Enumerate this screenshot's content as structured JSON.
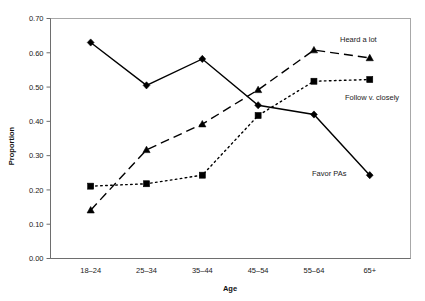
{
  "chart_data": {
    "type": "line",
    "title": "",
    "xlabel": "Age",
    "ylabel": "Proportion",
    "categories": [
      "18–24",
      "25–34",
      "35–44",
      "45–54",
      "55–64",
      "65+"
    ],
    "ylim": [
      0.0,
      0.7
    ],
    "ytick_labels": [
      "0.00",
      "0.10",
      "0.20",
      "0.30",
      "0.40",
      "0.50",
      "0.60",
      "0.70"
    ],
    "ytick_values": [
      0.0,
      0.1,
      0.2,
      0.3,
      0.4,
      0.5,
      0.6,
      0.7
    ],
    "grid": false,
    "legend_position": "inline-right-annotations",
    "series": [
      {
        "name": "Favor PAs",
        "marker": "diamond",
        "line_style": "solid",
        "values": [
          0.63,
          0.505,
          0.582,
          0.447,
          0.42,
          0.243
        ],
        "label_text": "Favor PAs"
      },
      {
        "name": "Heard a lot",
        "marker": "triangle",
        "line_style": "dashed",
        "values": [
          0.141,
          0.317,
          0.392,
          0.492,
          0.608,
          0.585
        ],
        "label_text": "Heard a lot"
      },
      {
        "name": "Follow v. closely",
        "marker": "square",
        "line_style": "dotted",
        "values": [
          0.211,
          0.218,
          0.243,
          0.417,
          0.517,
          0.522
        ],
        "label_text": "Follow v. closely"
      }
    ],
    "annotations": [
      {
        "text": "Heard a lot",
        "series": "Heard a lot"
      },
      {
        "text": "Follow v. closely",
        "series": "Follow v. closely"
      },
      {
        "text": "Favor PAs",
        "series": "Favor PAs"
      }
    ]
  },
  "axes": {
    "x_title": "Age",
    "y_title": "Proportion"
  }
}
